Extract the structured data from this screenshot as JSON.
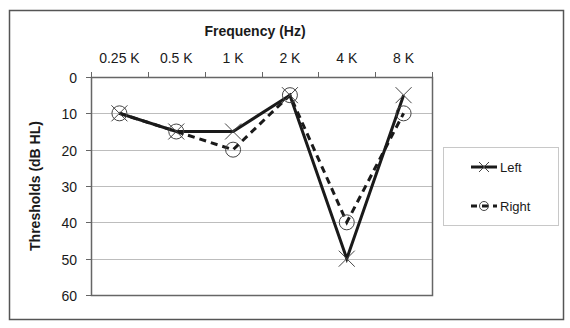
{
  "chart_data": {
    "type": "line",
    "title": "",
    "xlabel": "Frequency (Hz)",
    "ylabel": "Thresholds (dB HL)",
    "categories": [
      "0.25 K",
      "0.5 K",
      "1 K",
      "2 K",
      "4 K",
      "8 K"
    ],
    "ylim": [
      0,
      60
    ],
    "y_inverted": true,
    "y_ticks": [
      0,
      10,
      20,
      30,
      40,
      50,
      60
    ],
    "x_axis_position": "top",
    "grid": {
      "horizontal": true,
      "vertical": false
    },
    "legend_position": "right",
    "series": [
      {
        "name": "Left",
        "values": [
          10,
          15,
          15,
          5,
          50,
          5
        ],
        "line": "solid",
        "marker": "x",
        "color": "#1a1a1a"
      },
      {
        "name": "Right",
        "values": [
          10,
          15,
          20,
          5,
          40,
          10
        ],
        "line": "dashed",
        "marker": "circle",
        "color": "#1a1a1a"
      }
    ]
  },
  "colors": {
    "frame": "#555555",
    "grid": "#bdbdbd",
    "axis": "#666666",
    "legend_border": "#c8c8c8",
    "series": "#1a1a1a"
  }
}
